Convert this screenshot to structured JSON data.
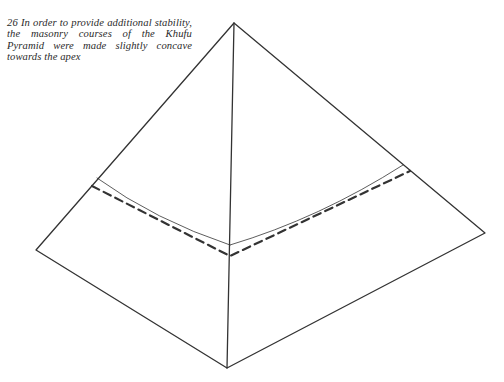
{
  "caption": {
    "number": "26",
    "text": "In order to provide additional stability, the masonry courses of the Khufu Pyramid were made slightly concave towards the apex"
  },
  "diagram": {
    "subject": "pyramid",
    "colors": {
      "stroke": "#333333",
      "background": "#ffffff"
    },
    "vertices": {
      "apex": [
        234,
        23
      ],
      "left": [
        36,
        250
      ],
      "right": [
        485,
        233
      ],
      "front_bottom": [
        227,
        368
      ]
    },
    "concave_course": {
      "left": [
        97,
        178
      ],
      "mid": [
        230,
        245
      ],
      "right": [
        403,
        165
      ]
    },
    "straight_course_dashed": {
      "left": [
        92,
        186
      ],
      "mid": [
        230,
        256
      ],
      "right": [
        410,
        171
      ]
    }
  }
}
